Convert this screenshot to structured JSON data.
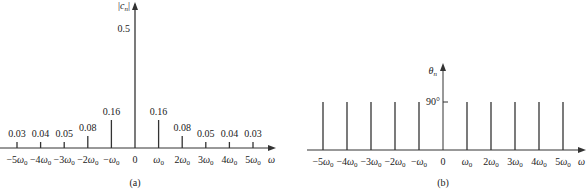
{
  "chart_data": [
    {
      "type": "bar",
      "subtype": "stem",
      "title": "(a)",
      "xlabel": "ω",
      "ylabel": "|c_n|",
      "categories": [
        "-5ω0",
        "-4ω0",
        "-3ω0",
        "-2ω0",
        "-ω0",
        "0",
        "ω0",
        "2ω0",
        "3ω0",
        "4ω0",
        "5ω0"
      ],
      "values": [
        0.03,
        0.04,
        0.05,
        0.08,
        0.16,
        0.5,
        0.16,
        0.08,
        0.05,
        0.04,
        0.03
      ],
      "value_labels": [
        "0.03",
        "0.04",
        "0.05",
        "0.08",
        "0.16",
        "0.5",
        "0.16",
        "0.08",
        "0.05",
        "0.04",
        "0.03"
      ],
      "grid": false
    },
    {
      "type": "bar",
      "subtype": "stem",
      "title": "(b)",
      "xlabel": "ω",
      "ylabel": "θ_n",
      "categories": [
        "-5ω0",
        "-4ω0",
        "-3ω0",
        "-2ω0",
        "-ω0",
        "0",
        "ω0",
        "2ω0",
        "3ω0",
        "4ω0",
        "5ω0"
      ],
      "values": [
        90,
        90,
        90,
        90,
        90,
        null,
        90,
        90,
        90,
        90,
        90
      ],
      "ytick_labels": [
        "90°"
      ],
      "grid": false
    }
  ],
  "labels": {
    "a": {
      "ylabel": "|c",
      "ylabel_sub": "n",
      "ylabel_close": "|",
      "caption": "(a)",
      "xaxis": "ω",
      "ticks": [
        "−5ω",
        "−4ω",
        "−3ω",
        "−2ω",
        "−ω",
        "0",
        "ω",
        "2ω",
        "3ω",
        "4ω",
        "5ω"
      ]
    },
    "b": {
      "ylabel": "θ",
      "ylabel_sub": "n",
      "ytick": "90°",
      "caption": "(b)",
      "xaxis": "ω",
      "ticks": [
        "−5ω",
        "−4ω",
        "−3ω",
        "−2ω",
        "−ω",
        "0",
        "ω",
        "2ω",
        "3ω",
        "4ω",
        "5ω"
      ]
    },
    "sub0": "0"
  }
}
